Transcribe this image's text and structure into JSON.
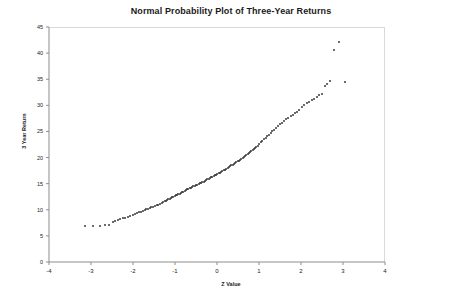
{
  "chart_data": {
    "type": "scatter",
    "title": "Normal Probability Plot of Three-Year Returns",
    "xlabel": "Z Value",
    "ylabel": "3 Year Return",
    "xlim": [
      -4,
      4
    ],
    "ylim": [
      0,
      45
    ],
    "xticks": [
      -4,
      -3,
      -2,
      -1,
      0,
      1,
      2,
      3,
      4
    ],
    "yticks": [
      0,
      5,
      10,
      15,
      20,
      25,
      30,
      35,
      40,
      45
    ],
    "grid": false,
    "legend": null,
    "marker": "diamond",
    "marker_color": "#3a3a3a",
    "series": [
      {
        "name": "Three-Year Returns",
        "x": [
          -3.15,
          -2.95,
          -2.78,
          -2.66,
          -2.56,
          -2.48,
          -2.42,
          -2.36,
          -2.3,
          -2.24,
          -2.18,
          -2.12,
          -2.06,
          -2.0,
          -1.95,
          -1.9,
          -1.85,
          -1.8,
          -1.76,
          -1.72,
          -1.68,
          -1.64,
          -1.6,
          -1.56,
          -1.52,
          -1.48,
          -1.44,
          -1.4,
          -1.36,
          -1.32,
          -1.28,
          -1.25,
          -1.22,
          -1.19,
          -1.16,
          -1.13,
          -1.1,
          -1.07,
          -1.04,
          -1.01,
          -0.98,
          -0.95,
          -0.92,
          -0.89,
          -0.86,
          -0.83,
          -0.8,
          -0.77,
          -0.74,
          -0.71,
          -0.68,
          -0.65,
          -0.62,
          -0.59,
          -0.56,
          -0.53,
          -0.5,
          -0.47,
          -0.44,
          -0.41,
          -0.38,
          -0.35,
          -0.32,
          -0.29,
          -0.26,
          -0.23,
          -0.2,
          -0.17,
          -0.14,
          -0.11,
          -0.08,
          -0.05,
          -0.02,
          0.01,
          0.04,
          0.07,
          0.1,
          0.13,
          0.16,
          0.19,
          0.22,
          0.25,
          0.28,
          0.31,
          0.34,
          0.37,
          0.4,
          0.43,
          0.46,
          0.49,
          0.52,
          0.55,
          0.58,
          0.61,
          0.64,
          0.67,
          0.7,
          0.73,
          0.76,
          0.79,
          0.82,
          0.85,
          0.88,
          0.91,
          0.94,
          0.97,
          1.0,
          1.04,
          1.08,
          1.12,
          1.16,
          1.2,
          1.24,
          1.28,
          1.32,
          1.36,
          1.4,
          1.45,
          1.5,
          1.55,
          1.6,
          1.65,
          1.7,
          1.75,
          1.8,
          1.85,
          1.9,
          1.96,
          2.02,
          2.08,
          2.14,
          2.2,
          2.26,
          2.32,
          2.38,
          2.44,
          2.5,
          2.56,
          2.62,
          2.68,
          2.78,
          2.9,
          3.05
        ],
        "y": [
          6.8,
          6.8,
          6.9,
          7.0,
          7.1,
          7.6,
          7.8,
          8.0,
          8.2,
          8.4,
          8.5,
          8.7,
          8.8,
          9.0,
          9.2,
          9.3,
          9.5,
          9.6,
          9.8,
          9.9,
          10.1,
          10.2,
          10.4,
          10.5,
          10.6,
          10.8,
          10.9,
          11.0,
          11.2,
          11.3,
          11.5,
          11.6,
          11.7,
          11.9,
          12.0,
          12.1,
          12.3,
          12.4,
          12.5,
          12.6,
          12.8,
          12.9,
          13.0,
          13.1,
          13.3,
          13.4,
          13.5,
          13.6,
          13.7,
          13.9,
          14.0,
          14.1,
          14.2,
          14.3,
          14.5,
          14.6,
          14.7,
          14.8,
          14.9,
          15.1,
          15.2,
          15.3,
          15.4,
          15.6,
          15.7,
          15.8,
          15.9,
          16.1,
          16.2,
          16.3,
          16.5,
          16.6,
          16.7,
          16.9,
          17.0,
          17.1,
          17.3,
          17.4,
          17.6,
          17.7,
          17.9,
          18.0,
          18.2,
          18.3,
          18.5,
          18.6,
          18.8,
          18.9,
          19.1,
          19.3,
          19.4,
          19.6,
          19.8,
          19.9,
          20.1,
          20.3,
          20.5,
          20.7,
          20.9,
          21.1,
          21.3,
          21.5,
          21.7,
          21.9,
          22.1,
          22.3,
          22.6,
          22.9,
          23.2,
          23.5,
          23.8,
          24.1,
          24.4,
          24.7,
          25.0,
          25.3,
          25.6,
          26.0,
          26.4,
          26.7,
          27.0,
          27.3,
          27.6,
          27.9,
          28.2,
          28.5,
          28.8,
          29.2,
          29.6,
          30.0,
          30.4,
          30.7,
          31.0,
          31.3,
          31.6,
          31.9,
          32.2,
          33.7,
          34.1,
          34.6,
          40.6,
          42.2,
          34.5
        ]
      }
    ]
  },
  "axis": {
    "x_tick_labels": [
      "-4",
      "-3",
      "-2",
      "-1",
      "0",
      "1",
      "2",
      "3",
      "4"
    ],
    "y_tick_labels": [
      "0",
      "5",
      "10",
      "15",
      "20",
      "25",
      "30",
      "35",
      "40",
      "45"
    ]
  }
}
